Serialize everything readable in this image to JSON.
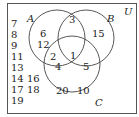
{
  "diagram": {
    "type": "venn",
    "universe_label": "U",
    "sets": [
      {
        "label": "A",
        "cx": 57,
        "cy": 38,
        "r": 28,
        "label_x": 27,
        "label_y": 21
      },
      {
        "label": "B",
        "cx": 86,
        "cy": 38,
        "r": 28,
        "label_x": 108,
        "label_y": 21
      },
      {
        "label": "C",
        "cx": 72,
        "cy": 64,
        "r": 28,
        "label_x": 96,
        "label_y": 105
      }
    ],
    "regions": {
      "A_only": [
        "6",
        "12"
      ],
      "B_only": [
        "15"
      ],
      "C_only": [
        "20",
        "10"
      ],
      "A_and_B_only": [
        "3"
      ],
      "A_and_C_only": [
        "2",
        "4"
      ],
      "B_and_C_only": [
        "5"
      ],
      "A_and_B_and_C": [
        "1"
      ],
      "outside": [
        "7",
        "8",
        "9",
        "11",
        "13",
        "14",
        "16",
        "17",
        "18",
        "19"
      ]
    },
    "colors": {
      "stroke": "#444444",
      "text": "#222222",
      "background": "#ffffff"
    }
  }
}
